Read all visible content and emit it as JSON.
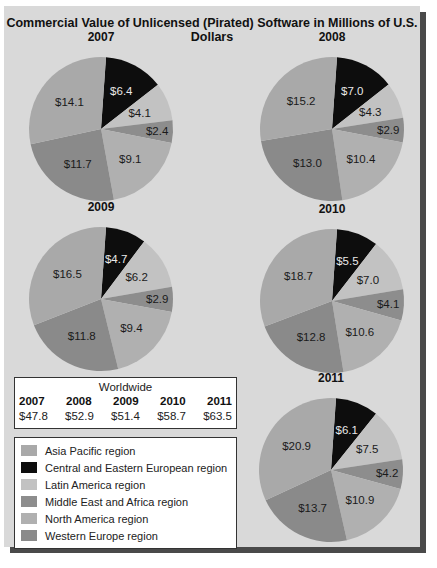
{
  "chart_data": [
    {
      "type": "pie",
      "title": "2007",
      "labels": [
        "Central and Eastern European region",
        "Latin America region",
        "Middle East and Africa region",
        "North America region",
        "Western Europe region",
        "Asia Pacific region"
      ],
      "values": [
        6.4,
        4.1,
        2.4,
        9.1,
        11.7,
        14.1
      ],
      "unit": "$M"
    },
    {
      "type": "pie",
      "title": "2008",
      "labels": [
        "Central and Eastern European region",
        "Latin America region",
        "Middle East and Africa region",
        "North America region",
        "Western Europe region",
        "Asia Pacific region"
      ],
      "values": [
        7.0,
        4.3,
        2.9,
        10.4,
        13.0,
        15.2
      ],
      "unit": "$M"
    },
    {
      "type": "pie",
      "title": "2009",
      "labels": [
        "Central and Eastern European region",
        "Latin America region",
        "Middle East and Africa region",
        "North America region",
        "Western Europe region",
        "Asia Pacific region"
      ],
      "values": [
        4.7,
        6.2,
        2.9,
        9.4,
        11.8,
        16.5
      ],
      "unit": "$M"
    },
    {
      "type": "pie",
      "title": "2010",
      "labels": [
        "Central and Eastern European region",
        "Latin America region",
        "Middle East and Africa region",
        "North America region",
        "Western Europe region",
        "Asia Pacific region"
      ],
      "values": [
        5.5,
        7.0,
        4.1,
        10.6,
        12.8,
        18.7
      ],
      "unit": "$M"
    },
    {
      "type": "pie",
      "title": "2011",
      "labels": [
        "Central and Eastern European region",
        "Latin America region",
        "Middle East and Africa region",
        "North America region",
        "Western Europe region",
        "Asia Pacific region"
      ],
      "values": [
        6.1,
        7.5,
        4.2,
        10.9,
        13.7,
        20.9
      ],
      "unit": "$M"
    }
  ],
  "title": "Commercial Value of Unlicensed (Pirated) Software in Millions of U.S. Dollars",
  "colors": {
    "cee": "#0d0d0d",
    "latam": "#c2c2c2",
    "mea": "#8d8d8d",
    "na": "#b0b0b0",
    "we": "#8a8a8a",
    "ap": "#a9a9a9"
  },
  "pies": [
    {
      "year": "2007",
      "labels": [
        "$6.4",
        "$4.1",
        "$2.4",
        "$9.1",
        "$11.7",
        "$14.1"
      ]
    },
    {
      "year": "2008",
      "labels": [
        "$7.0",
        "$4.3",
        "$2.9",
        "$10.4",
        "$13.0",
        "$15.2"
      ]
    },
    {
      "year": "2009",
      "labels": [
        "$4.7",
        "$6.2",
        "$2.9",
        "$9.4",
        "$11.8",
        "$16.5"
      ]
    },
    {
      "year": "2010",
      "labels": [
        "$5.5",
        "$7.0",
        "$4.1",
        "$10.6",
        "$12.8",
        "$18.7"
      ]
    },
    {
      "year": "2011",
      "labels": [
        "$6.1",
        "$7.5",
        "$4.2",
        "$10.9",
        "$13.7",
        "$20.9"
      ]
    }
  ],
  "worldwide": {
    "title": "Worldwide",
    "years": [
      "2007",
      "2008",
      "2009",
      "2010",
      "2011"
    ],
    "values": [
      "$47.8",
      "$52.9",
      "$51.4",
      "$58.7",
      "$63.5"
    ]
  },
  "legend": [
    {
      "label": "Asia Pacific region",
      "color": "#a9a9a9"
    },
    {
      "label": "Central and Eastern European region",
      "color": "#0d0d0d"
    },
    {
      "label": "Latin America region",
      "color": "#c2c2c2"
    },
    {
      "label": "Middle East and Africa region",
      "color": "#8d8d8d"
    },
    {
      "label": "North America region",
      "color": "#b0b0b0"
    },
    {
      "label": "Western Europe region",
      "color": "#8a8a8a"
    }
  ]
}
